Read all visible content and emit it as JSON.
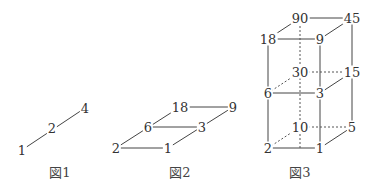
{
  "figures": [
    {
      "caption": "図1",
      "nodes": {
        "a": "1",
        "b": "2",
        "c": "4"
      }
    },
    {
      "caption": "図2",
      "nodes": {
        "a": "2",
        "b": "1",
        "c": "6",
        "d": "3",
        "e": "18",
        "f": "9"
      }
    },
    {
      "caption": "図3",
      "nodes": {
        "top_back_left": "90",
        "top_back_right": "45",
        "top_front_left": "18",
        "top_front_right": "9",
        "mid_back_left": "30",
        "mid_back_right": "15",
        "mid_front_left": "6",
        "mid_front_right": "3",
        "bot_back_left": "10",
        "bot_back_right": "5",
        "bot_front_left": "2",
        "bot_front_right": "1"
      }
    }
  ],
  "colors": {
    "line": "#444444",
    "text": "#333333",
    "background": "#ffffff"
  }
}
